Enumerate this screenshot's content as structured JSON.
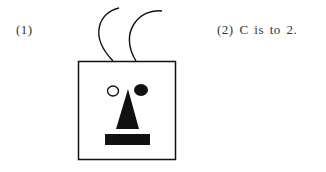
{
  "labels": {
    "item1": "(1)",
    "item2": "(2) C is to 2."
  },
  "figure": {
    "colors": {
      "stroke": "#111111",
      "fill": "#111111",
      "background": "#ffffff"
    }
  }
}
